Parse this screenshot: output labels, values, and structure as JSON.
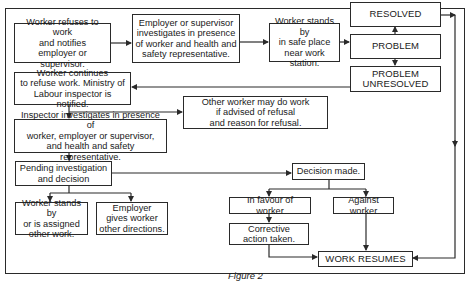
{
  "figure": {
    "caption": "Figure 2",
    "nodes": {
      "worker_refuses": "Worker refuses to work\nand notifies\nemployer or supervisor.",
      "employer_investigates": "Employer or supervisor\ninvestigates in presence\nof worker and health and\nsafety representative.",
      "worker_stands_safe": "Worker stands by\nin safe place\nnear work station.",
      "resolved": "RESOLVED",
      "problem": "PROBLEM",
      "problem_unresolved": "PROBLEM\nUNRESOLVED",
      "worker_continues": "Worker continues\nto refuse work. Ministry of\nLabour inspector is notified.",
      "other_worker": "Other worker may do work\nif advised of refusal\nand reason for refusal.",
      "inspector_investigates": "Inspector investigates in presence of\nworker, employer or supervisor,\nand health and safety representative.",
      "pending": "Pending investigation\nand decision",
      "worker_stands_assigned": "Worker stands by\nor is assigned\nother work.",
      "employer_directions": "Employer\ngives worker\nother directions.",
      "decision_made": "Decision made.",
      "in_favour": "In favour of worker",
      "against": "Against worker",
      "corrective": "Corrective\naction taken.",
      "work_resumes": "WORK RESUMES"
    },
    "edges": [
      [
        "worker_refuses",
        "employer_investigates"
      ],
      [
        "employer_investigates",
        "worker_stands_safe"
      ],
      [
        "worker_stands_safe",
        "problem"
      ],
      [
        "problem",
        "resolved"
      ],
      [
        "problem",
        "problem_unresolved"
      ],
      [
        "problem_unresolved",
        "worker_continues"
      ],
      [
        "worker_continues",
        "other_worker"
      ],
      [
        "worker_continues",
        "inspector_investigates"
      ],
      [
        "inspector_investigates",
        "pending"
      ],
      [
        "pending",
        "worker_stands_assigned"
      ],
      [
        "pending",
        "employer_directions"
      ],
      [
        "pending",
        "decision_made"
      ],
      [
        "decision_made",
        "in_favour"
      ],
      [
        "decision_made",
        "against"
      ],
      [
        "in_favour",
        "corrective"
      ],
      [
        "corrective",
        "work_resumes"
      ],
      [
        "against",
        "work_resumes"
      ],
      [
        "resolved",
        "work_resumes"
      ]
    ],
    "colors": {
      "line": "#2a2a2a",
      "background": "#ffffff"
    }
  }
}
